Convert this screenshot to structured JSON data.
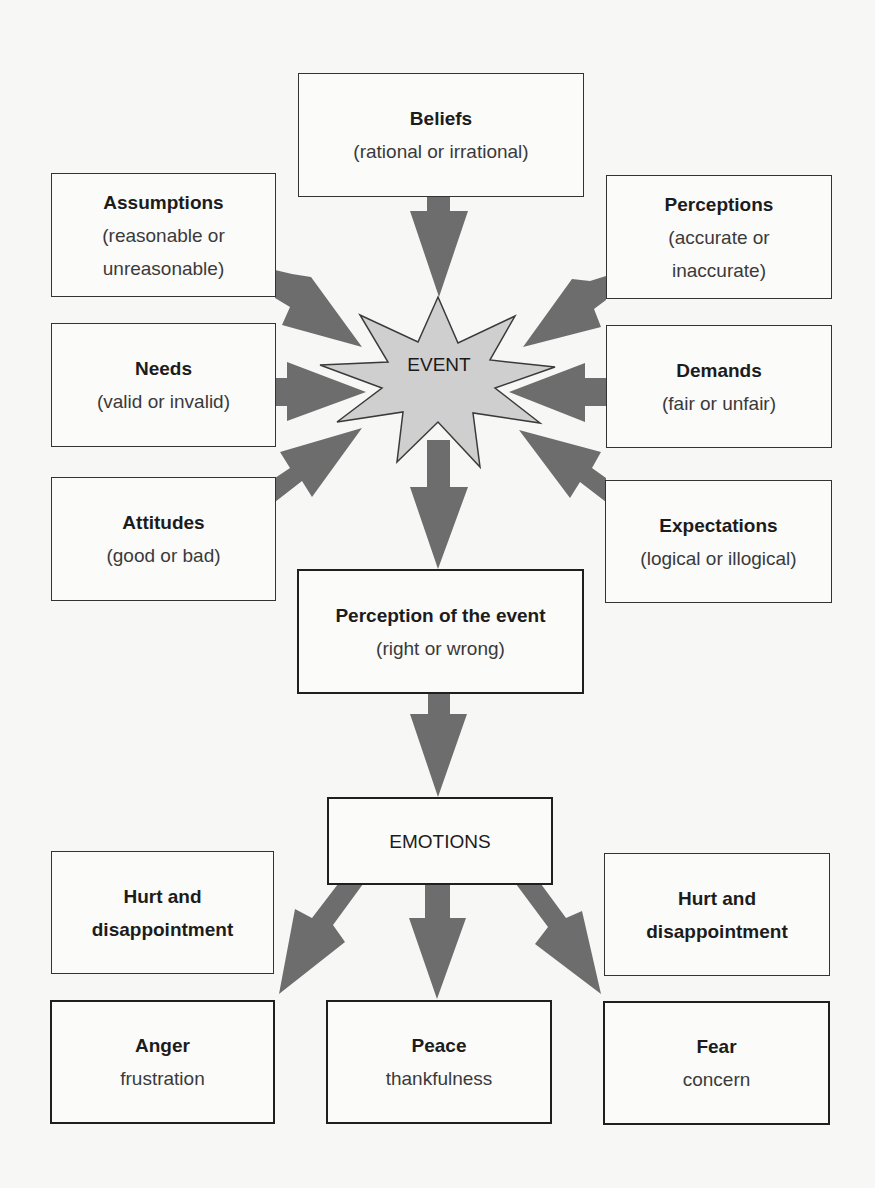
{
  "colors": {
    "arrow": "#6d6d6d",
    "star_fill": "#cfcfcf",
    "star_stroke": "#3a3a3a",
    "box_border": "#333333",
    "background": "#f7f7f6"
  },
  "center": {
    "label": "EVENT",
    "icon": "starburst-icon"
  },
  "influences": {
    "beliefs": {
      "title": "Beliefs",
      "sub": "(rational or irrational)"
    },
    "assumptions": {
      "title": "Assumptions",
      "sub_line1": "(reasonable or",
      "sub_line2": "unreasonable)"
    },
    "perceptions": {
      "title": "Perceptions",
      "sub_line1": "(accurate or",
      "sub_line2": "inaccurate)"
    },
    "needs": {
      "title": "Needs",
      "sub": "(valid or invalid)"
    },
    "demands": {
      "title": "Demands",
      "sub": "(fair or unfair)"
    },
    "attitudes": {
      "title": "Attitudes",
      "sub": "(good or bad)"
    },
    "expectations": {
      "title": "Expectations",
      "sub": "(logical or illogical)"
    }
  },
  "perception_of_event": {
    "title": "Perception of the event",
    "sub": "(right or wrong)"
  },
  "emotions": {
    "label": "EMOTIONS"
  },
  "outcomes": {
    "hurt_left": {
      "line1": "Hurt and",
      "line2": "disappointment"
    },
    "hurt_right": {
      "line1": "Hurt and",
      "line2": "disappointment"
    },
    "anger": {
      "title": "Anger",
      "sub": "frustration"
    },
    "peace": {
      "title": "Peace",
      "sub": "thankfulness"
    },
    "fear": {
      "title": "Fear",
      "sub": "concern"
    }
  }
}
